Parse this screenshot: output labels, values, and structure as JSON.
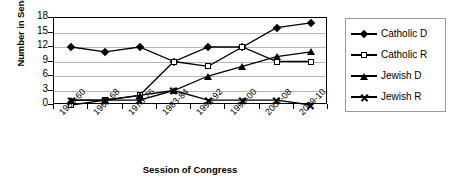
{
  "chart_data": {
    "type": "line",
    "title": "",
    "xlabel": "Session of Congress",
    "ylabel": "Number in Senate",
    "categories": [
      "1959-60",
      "1967-68",
      "1975-76",
      "1983-84",
      "1991-92",
      "1999-00",
      "2007-08",
      "2009-10"
    ],
    "ylim": [
      0,
      18
    ],
    "yticks": [
      0,
      3,
      6,
      9,
      12,
      15,
      18
    ],
    "grid": true,
    "legend_position": "right",
    "series": [
      {
        "name": "Catholic D",
        "marker": "filled-diamond",
        "values": [
          12,
          11,
          12,
          9,
          12,
          12,
          16,
          17
        ]
      },
      {
        "name": "Catholic R",
        "marker": "open-square",
        "values": [
          0,
          1,
          2,
          9,
          8,
          12,
          9,
          9
        ]
      },
      {
        "name": "Jewish D",
        "marker": "filled-triangle",
        "values": [
          1,
          1,
          2,
          3,
          6,
          8,
          10,
          11
        ]
      },
      {
        "name": "Jewish R",
        "marker": "x-cross",
        "values": [
          1,
          1,
          1,
          3,
          1,
          1,
          1,
          0
        ]
      }
    ]
  },
  "axis": {
    "y_title": "Number in Senate",
    "x_title": "Session of Congress"
  },
  "colors": {
    "line": "#000000",
    "grid": "#b5b5b5",
    "frame": "#000000",
    "legend_border": "#9a9a9a",
    "background": "#ffffff"
  }
}
